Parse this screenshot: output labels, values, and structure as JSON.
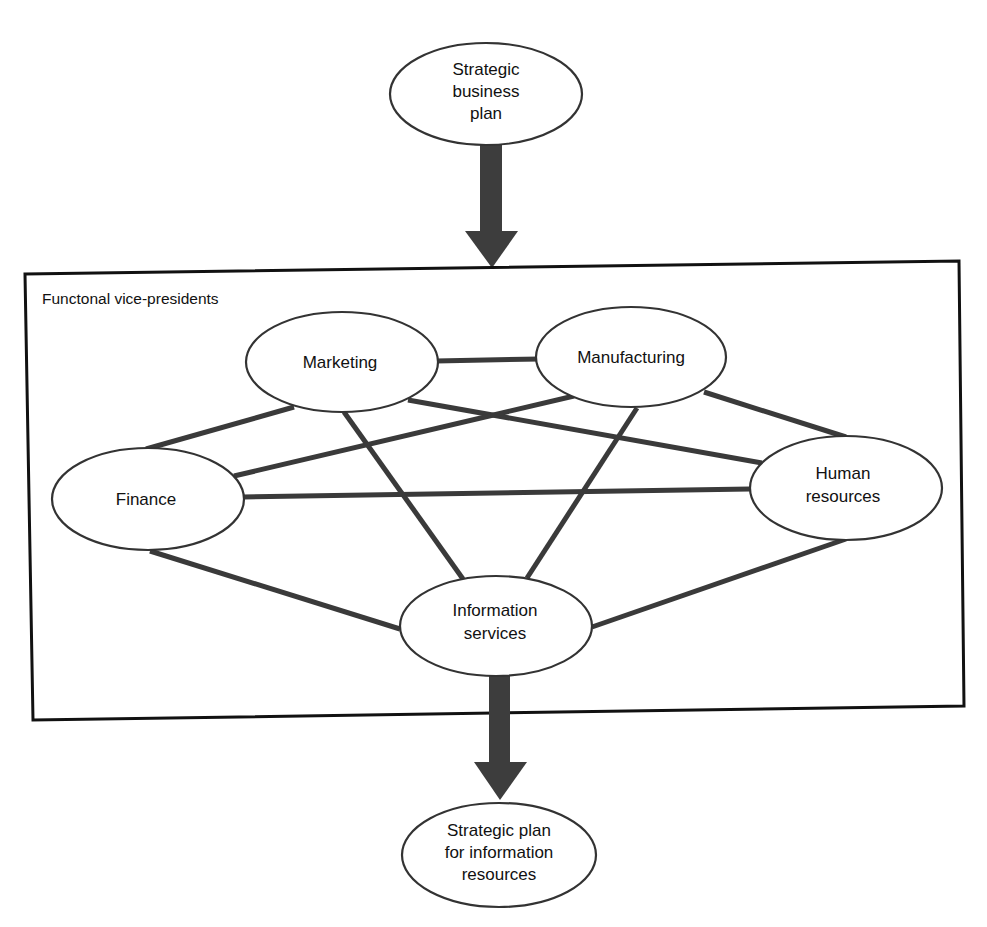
{
  "diagram": {
    "frame": {
      "label": "Functonal vice-presidents"
    },
    "nodes": {
      "strategic_business_plan": {
        "lines": [
          "Strategic",
          "business",
          "plan"
        ]
      },
      "marketing": {
        "lines": [
          "Marketing"
        ]
      },
      "manufacturing": {
        "lines": [
          "Manufacturing"
        ]
      },
      "finance": {
        "lines": [
          "Finance"
        ]
      },
      "human_resources": {
        "lines": [
          "Human",
          "resources"
        ]
      },
      "information_services": {
        "lines": [
          "Information",
          "services"
        ]
      },
      "strategic_plan_ir": {
        "lines": [
          "Strategic plan",
          "for information",
          "resources"
        ]
      }
    },
    "edges": [
      {
        "from": "Marketing",
        "to": "Manufacturing"
      },
      {
        "from": "Marketing",
        "to": "Finance"
      },
      {
        "from": "Marketing",
        "to": "Human resources"
      },
      {
        "from": "Marketing",
        "to": "Information services"
      },
      {
        "from": "Manufacturing",
        "to": "Finance"
      },
      {
        "from": "Manufacturing",
        "to": "Human resources"
      },
      {
        "from": "Manufacturing",
        "to": "Information services"
      },
      {
        "from": "Finance",
        "to": "Human resources"
      },
      {
        "from": "Finance",
        "to": "Information services"
      },
      {
        "from": "Human resources",
        "to": "Information services"
      }
    ],
    "flow_arrows": [
      {
        "from": "Strategic business plan",
        "to": "Functonal vice-presidents"
      },
      {
        "from": "Information services",
        "to": "Strategic plan for information resources"
      }
    ],
    "colors": {
      "edge": "#3a3a3a",
      "arrow": "#3d3d3d",
      "frame": "#111111",
      "node_fill": "#ffffff",
      "node_stroke": "#333333"
    }
  }
}
